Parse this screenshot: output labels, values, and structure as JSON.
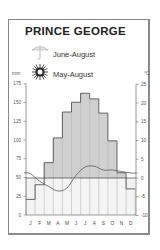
{
  "title": "PRINCE GEORGE",
  "legend": [
    {
      "icon": "umbrella-icon",
      "label": "June-August"
    },
    {
      "icon": "sun-icon",
      "label": "May-August"
    }
  ],
  "units": {
    "left": "mm",
    "right": "°C"
  },
  "colors": {
    "bar_fill": "#d0d0d0",
    "bar_stroke": "#555555",
    "line": "#666666",
    "frame": "#8a8a8a"
  },
  "chart_data": {
    "type": "bar",
    "title": "PRINCE GEORGE",
    "categories": [
      "J",
      "F",
      "M",
      "A",
      "M",
      "J",
      "J",
      "A",
      "S",
      "O",
      "N",
      "D"
    ],
    "series": [
      {
        "name": "Temperature (°C)",
        "type": "bar",
        "axis": "right",
        "values": [
          -5.7,
          -1.8,
          4.1,
          10.7,
          17.6,
          20.2,
          22.6,
          21.1,
          17.3,
          9.9,
          1.4,
          -2.9
        ]
      },
      {
        "name": "Precipitation (mm)",
        "type": "line",
        "axis": "left",
        "values": [
          55,
          45,
          38,
          32,
          36,
          53,
          64,
          65,
          60,
          60,
          58,
          56
        ]
      }
    ],
    "left_axis": {
      "label": "mm",
      "ticks": [
        0,
        25,
        50,
        75,
        100,
        125,
        150,
        175
      ],
      "range": [
        0,
        175
      ]
    },
    "right_axis": {
      "label": "°C",
      "ticks": [
        -10,
        -5,
        0,
        5,
        10,
        15,
        20,
        25
      ],
      "range": [
        -10,
        25
      ]
    },
    "legend": [
      "June-August (wettest)",
      "May-August (sunniest)"
    ],
    "grid": false
  }
}
